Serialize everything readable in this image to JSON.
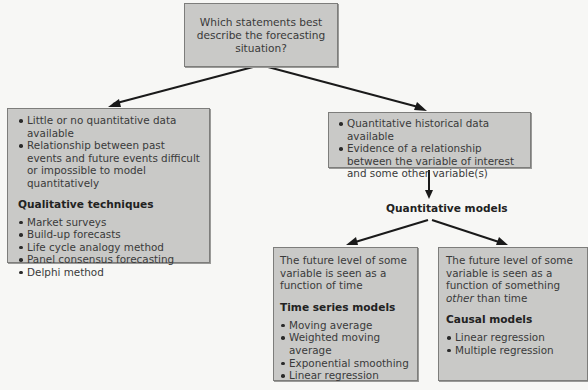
{
  "diagram": {
    "root": {
      "lines": [
        "Which statements best",
        "describe the forecasting situation?"
      ]
    },
    "qualitative_branch": {
      "conditions": [
        "Little or no quantitative data available",
        "Relationship between past events and future events difficult or impossible to model quantitatively"
      ],
      "heading": "Qualitative techniques",
      "techniques": [
        "Market surveys",
        "Build-up forecasts",
        "Life cycle analogy method",
        "Panel consensus forecasting",
        "Delphi method"
      ]
    },
    "quantitative_branch": {
      "conditions": [
        "Quantitative historical data available",
        "Evidence of a relationship between the variable of interest and some other variable(s)"
      ],
      "label": "Quantitative models",
      "time_series": {
        "description": "The future level of some variable is seen as a function of time",
        "heading": "Time series models",
        "models": [
          "Moving average",
          "Weighted moving average",
          "Exponential smoothing",
          "Linear regression"
        ]
      },
      "causal": {
        "description_before": "The future level of some variable is seen as a function of something ",
        "description_emphasis": "other",
        "description_after": " than time",
        "heading": "Causal models",
        "models": [
          "Linear regression",
          "Multiple regression"
        ]
      }
    },
    "colors": {
      "box_fill": "#c9c9c7",
      "box_border": "#7d7d7b",
      "arrow": "#1a1a1a",
      "background": "#f7f7f5"
    }
  }
}
